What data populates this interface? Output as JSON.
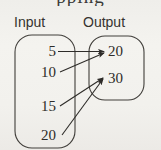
{
  "figure": {
    "type": "mapping-diagram",
    "clipped_top_text": "pping",
    "background_color": "#f1f0ec",
    "ink_color": "#2e2c29",
    "headers": {
      "input_label": "Input",
      "output_label": "Output"
    },
    "input_set": {
      "name": "Input",
      "values": [
        "5",
        "10",
        "15",
        "20"
      ]
    },
    "output_set": {
      "name": "Output",
      "values": [
        "20",
        "30"
      ]
    },
    "mappings": [
      {
        "from": "5",
        "to": "20"
      },
      {
        "from": "10",
        "to": "20"
      },
      {
        "from": "15",
        "to": "30"
      },
      {
        "from": "20",
        "to": "30"
      }
    ]
  }
}
